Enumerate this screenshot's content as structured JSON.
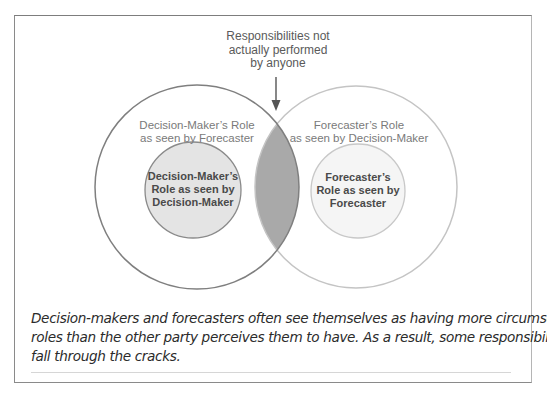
{
  "figure": {
    "top_label": {
      "lines": [
        "Responsibilities not",
        "actually performed",
        "by anyone"
      ]
    },
    "left_outer": {
      "lines": [
        "Decision-Maker’s Role",
        "as seen by Forecaster"
      ]
    },
    "right_outer": {
      "lines": [
        "Forecaster’s Role",
        "as seen by Decision-Maker"
      ]
    },
    "left_inner": {
      "lines": [
        "Decision-Maker’s",
        "Role as seen by",
        "Decision-Maker"
      ]
    },
    "right_inner": {
      "lines": [
        "Forecaster’s",
        "Role as seen by",
        "Forecaster"
      ]
    },
    "colors": {
      "left_outer_stroke": "#7f7f7f",
      "right_outer_stroke": "#c4c4c4",
      "left_inner_fill": "#e4e4e4",
      "left_inner_stroke": "#8a8a8a",
      "right_inner_fill": "#f5f5f5",
      "right_inner_stroke": "#c8c8c8",
      "overlap_fill": "#a9a9a9",
      "arrow": "#555555"
    }
  },
  "caption": {
    "lines": [
      "Decision-makers and forecasters often see themselves as having more circumscribed",
      "roles than the other party perceives them to have. As a result, some responsibilities",
      "fall through the cracks."
    ]
  }
}
